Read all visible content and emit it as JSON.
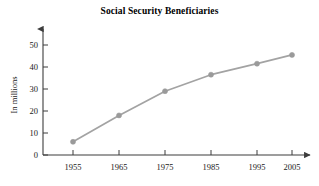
{
  "chart_data": {
    "type": "line",
    "title": "Social Security Beneficiaries",
    "xlabel": "",
    "ylabel": "In millions",
    "x": [
      1955,
      1965,
      1975,
      1985,
      1995,
      2005
    ],
    "categories": [
      "1955",
      "1965",
      "1975",
      "1985",
      "1995",
      "2005"
    ],
    "values": [
      6,
      18,
      29,
      36.5,
      41.5,
      45.5
    ],
    "series": [
      {
        "name": "Social Security Beneficiaries",
        "values": [
          6,
          18,
          29,
          36.5,
          41.5,
          45.5
        ]
      }
    ],
    "xlim": [
      1950,
      2009
    ],
    "ylim": [
      0,
      55
    ],
    "yticks": [
      0,
      10,
      20,
      30,
      40,
      50
    ],
    "ytick_labels": [
      "0",
      "10",
      "20",
      "30",
      "40",
      "50"
    ],
    "xticks": [
      1955,
      1965,
      1975,
      1985,
      1995,
      2005
    ],
    "xtick_labels": [
      "1955",
      "1965",
      "1975",
      "1985",
      "1995",
      "2005"
    ],
    "grid": false,
    "legend": false,
    "marker": "circle",
    "line_color": "#a3a3a3",
    "marker_color": "#9a9a9a",
    "axis_color": "#3d3d3d",
    "text_color": "#1a1a1a",
    "background": "#ffffff",
    "axis_arrows": true
  }
}
